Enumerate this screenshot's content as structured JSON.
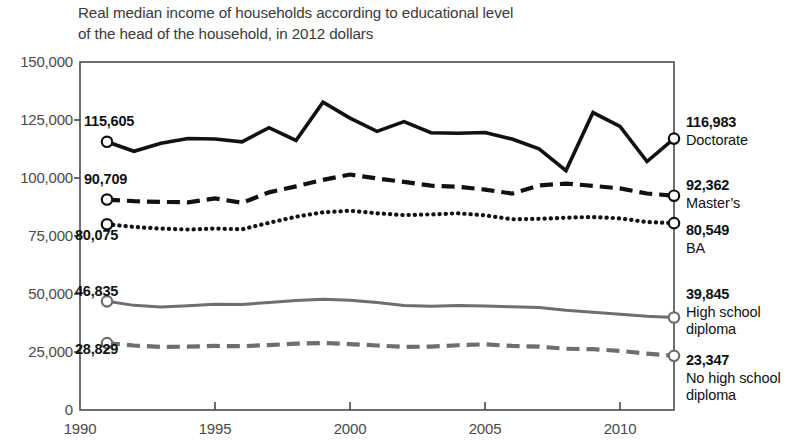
{
  "title": {
    "line1": "Real median income of households according to educational level",
    "line2": "of the head of the household, in 2012 dollars"
  },
  "axes": {
    "y_ticks": [
      "150,000",
      "125,000",
      "100,000",
      "75,000",
      "50,000",
      "25,000",
      "0"
    ],
    "x_ticks": [
      "1990",
      "1995",
      "2000",
      "2005",
      "2010"
    ]
  },
  "start_labels": {
    "doctorate": "115,605",
    "masters": "90,709",
    "ba": "80,075",
    "highschool": "46,835",
    "nohighschool": "28,829"
  },
  "end_labels": {
    "doctorate_value": "116,983",
    "doctorate_name": "Doctorate",
    "masters_value": "92,362",
    "masters_name": "Master’s",
    "ba_value": "80,549",
    "ba_name": "BA",
    "highschool_value": "39,845",
    "highschool_name_1": "High school",
    "highschool_name_2": "diploma",
    "nohighschool_value": "23,347",
    "nohighschool_name_1": "No high school",
    "nohighschool_name_2": "diploma"
  },
  "colors": {
    "dark": "#111111",
    "gray": "#6e6e6e",
    "axis": "#4a4a4a",
    "text": "#231f20"
  },
  "chart_data": {
    "type": "line",
    "title": "Real median income of households according to educational level of the head of the household, in 2012 dollars",
    "xlabel": "",
    "ylabel": "",
    "xlim": [
      1990,
      2012
    ],
    "ylim": [
      0,
      150000
    ],
    "grid": false,
    "legend": "right-inline-labels",
    "x": [
      1991,
      1992,
      1993,
      1994,
      1995,
      1996,
      1997,
      1998,
      1999,
      2000,
      2001,
      2002,
      2003,
      2004,
      2005,
      2006,
      2007,
      2008,
      2009,
      2010,
      2011,
      2012
    ],
    "series": [
      {
        "name": "Doctorate",
        "style": "solid",
        "color": "#111111",
        "start_value": 115605,
        "end_value": 116983,
        "values": [
          115605,
          111500,
          115000,
          117000,
          116800,
          115600,
          121700,
          116200,
          132700,
          125800,
          120100,
          124300,
          119500,
          119300,
          119600,
          116800,
          112600,
          103200,
          128200,
          122200,
          107100,
          116983
        ]
      },
      {
        "name": "Master’s",
        "style": "dashed",
        "color": "#111111",
        "start_value": 90709,
        "end_value": 92362,
        "values": [
          90709,
          90000,
          89700,
          89500,
          91200,
          89300,
          93800,
          96400,
          99200,
          101500,
          99800,
          98300,
          96700,
          96200,
          95000,
          93300,
          96800,
          97600,
          96600,
          95500,
          93300,
          92362
        ]
      },
      {
        "name": "BA",
        "style": "dotted",
        "color": "#111111",
        "start_value": 80075,
        "end_value": 80549,
        "values": [
          80075,
          78900,
          78200,
          77800,
          78200,
          77900,
          80700,
          83300,
          85200,
          85900,
          84800,
          84000,
          84300,
          84800,
          83900,
          82200,
          82400,
          82900,
          83200,
          82600,
          81000,
          80549
        ]
      },
      {
        "name": "High school diploma",
        "style": "solid",
        "color": "#6e6e6e",
        "start_value": 46835,
        "end_value": 39845,
        "values": [
          46835,
          45100,
          44400,
          44900,
          45600,
          45500,
          46300,
          47200,
          47700,
          47300,
          46300,
          45000,
          44700,
          45000,
          44800,
          44500,
          44200,
          43000,
          42100,
          41300,
          40400,
          39845
        ]
      },
      {
        "name": "No high school diploma",
        "style": "dashed",
        "color": "#6e6e6e",
        "start_value": 28829,
        "end_value": 23347,
        "values": [
          28829,
          27800,
          27200,
          27300,
          27600,
          27500,
          28000,
          28600,
          28900,
          28400,
          27800,
          27200,
          27300,
          27900,
          28300,
          27600,
          27300,
          26400,
          26200,
          25500,
          24300,
          23347
        ]
      }
    ]
  }
}
